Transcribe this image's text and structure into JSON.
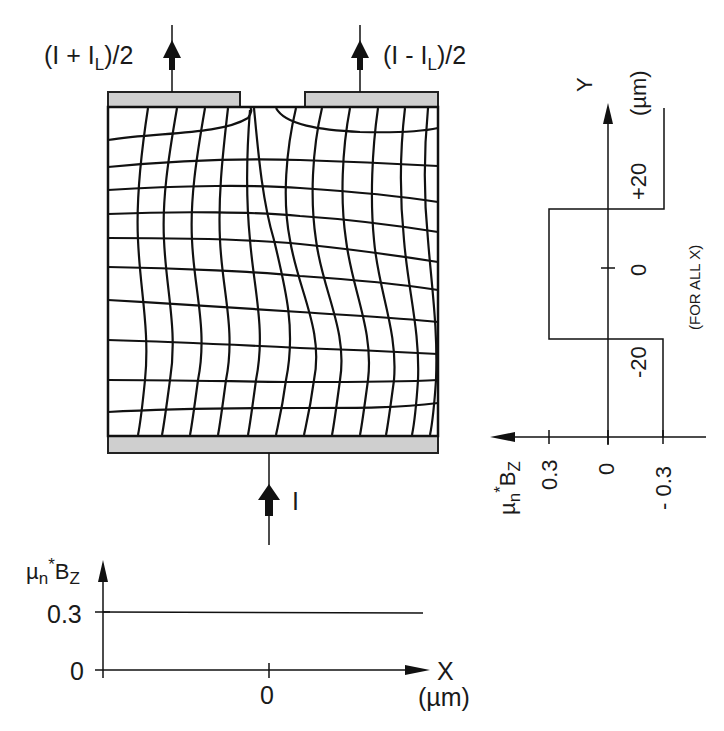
{
  "device": {
    "top_left_current": {
      "open": "(I + I",
      "sub": "L",
      "close": ")/2"
    },
    "top_right_current": {
      "open": "(I - I",
      "sub": "L",
      "close": ")/2"
    },
    "bottom_current": "I",
    "colors": {
      "ink": "#111111",
      "contact_fill": "#cfcfcf",
      "background": "#ffffff"
    }
  },
  "right_profile": {
    "axis_y_label": "Y",
    "axis_y_unit": "(µm)",
    "y_ticks": [
      "+20",
      "0",
      "-20"
    ],
    "note": "(FOR ALL X)",
    "axis_x_label": {
      "mu": "µ",
      "n": "n",
      "star": "*",
      "B": "B",
      "z": "Z"
    },
    "x_ticks": [
      "0.3",
      "0",
      "- 0.3"
    ]
  },
  "bottom_profile": {
    "axis_y_label": {
      "mu": "µ",
      "n": "n",
      "star": "*",
      "B": "B",
      "z": "Z"
    },
    "y_ticks": [
      "0.3",
      "0"
    ],
    "axis_x_label": "X",
    "axis_x_unit": "(µm)",
    "x_ticks": [
      "0"
    ]
  }
}
